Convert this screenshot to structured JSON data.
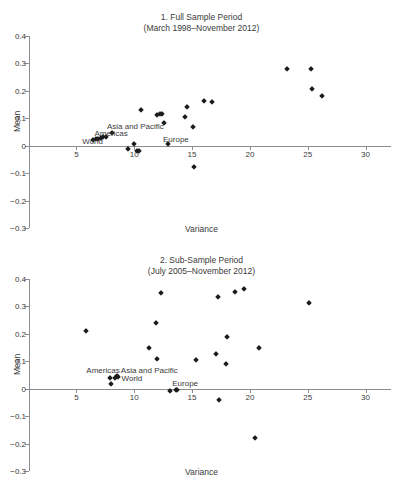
{
  "figure": {
    "axis_color": "#8d8d8d",
    "marker_color": "#1c1c1c",
    "text_color": "#3a3a3a",
    "xlabel": "Variance",
    "ylabel": "Mean",
    "y_ticks": [
      "0.4",
      "0.3",
      "0.2",
      "0.1",
      "0",
      "-0.1",
      "-0.2",
      "-0.3"
    ],
    "x_ticks": [
      "5",
      "10",
      "15",
      "20",
      "25",
      "30"
    ]
  },
  "chart_data": [
    {
      "type": "scatter",
      "title": "1. Full Sample Period",
      "subtitle": "(March 1998–November 2012)",
      "xlabel": "Variance",
      "ylabel": "Mean",
      "xlim": [
        0,
        30
      ],
      "ylim": [
        -0.3,
        0.4
      ],
      "grid": false,
      "legend": "none",
      "x_ticks": [
        5,
        10,
        15,
        20,
        25,
        30
      ],
      "y_ticks": [
        -0.3,
        -0.2,
        -0.1,
        0,
        0.1,
        0.2,
        0.3,
        0.4
      ],
      "points": [
        {
          "x": 6.4,
          "y": 0.022
        },
        {
          "x": 6.7,
          "y": 0.024
        },
        {
          "x": 6.9,
          "y": 0.026
        },
        {
          "x": 7.1,
          "y": 0.028
        },
        {
          "x": 7.3,
          "y": 0.03
        },
        {
          "x": 7.6,
          "y": 0.033
        },
        {
          "x": 8.1,
          "y": 0.046
        },
        {
          "x": 9.5,
          "y": -0.012
        },
        {
          "x": 10.0,
          "y": 0.005
        },
        {
          "x": 10.2,
          "y": -0.018
        },
        {
          "x": 10.4,
          "y": -0.02
        },
        {
          "x": 10.6,
          "y": 0.129
        },
        {
          "x": 12.0,
          "y": 0.113
        },
        {
          "x": 12.2,
          "y": 0.116
        },
        {
          "x": 12.4,
          "y": 0.114
        },
        {
          "x": 12.6,
          "y": 0.081
        },
        {
          "x": 12.9,
          "y": 0.008
        },
        {
          "x": 14.4,
          "y": 0.106
        },
        {
          "x": 14.6,
          "y": 0.14
        },
        {
          "x": 15.1,
          "y": 0.069
        },
        {
          "x": 15.2,
          "y": -0.077
        },
        {
          "x": 16.0,
          "y": 0.163
        },
        {
          "x": 16.7,
          "y": 0.16
        },
        {
          "x": 23.2,
          "y": 0.278
        },
        {
          "x": 25.3,
          "y": 0.28
        },
        {
          "x": 25.4,
          "y": 0.208
        },
        {
          "x": 26.2,
          "y": 0.182
        }
      ],
      "annotations": [
        {
          "text": "Asia and Pacific",
          "x": 10.1,
          "y": 0.072
        },
        {
          "text": "Americas",
          "x": 8.0,
          "y": 0.046
        },
        {
          "text": "World",
          "x": 6.4,
          "y": 0.018
        },
        {
          "text": "Europe",
          "x": 13.6,
          "y": 0.024
        }
      ]
    },
    {
      "type": "scatter",
      "title": "2. Sub-Sample Period",
      "subtitle": "(July 2005–November 2012)",
      "xlabel": "Variance",
      "ylabel": "Mean",
      "xlim": [
        0,
        30
      ],
      "ylim": [
        -0.3,
        0.4
      ],
      "grid": false,
      "legend": "none",
      "x_ticks": [
        5,
        10,
        15,
        20,
        25,
        30
      ],
      "y_ticks": [
        -0.3,
        -0.2,
        -0.1,
        0,
        0.1,
        0.2,
        0.3,
        0.4
      ],
      "points": [
        {
          "x": 5.8,
          "y": 0.212
        },
        {
          "x": 7.9,
          "y": 0.038
        },
        {
          "x": 8.0,
          "y": 0.016
        },
        {
          "x": 8.3,
          "y": 0.04
        },
        {
          "x": 8.5,
          "y": 0.048
        },
        {
          "x": 8.6,
          "y": 0.044
        },
        {
          "x": 11.3,
          "y": 0.148
        },
        {
          "x": 11.9,
          "y": 0.24
        },
        {
          "x": 12.0,
          "y": 0.109
        },
        {
          "x": 12.3,
          "y": 0.348
        },
        {
          "x": 13.1,
          "y": -0.007
        },
        {
          "x": 13.6,
          "y": -0.004
        },
        {
          "x": 13.7,
          "y": -0.005
        },
        {
          "x": 15.3,
          "y": 0.105
        },
        {
          "x": 17.1,
          "y": 0.128
        },
        {
          "x": 17.2,
          "y": 0.334
        },
        {
          "x": 17.3,
          "y": -0.042
        },
        {
          "x": 17.9,
          "y": 0.09
        },
        {
          "x": 18.0,
          "y": 0.19
        },
        {
          "x": 18.7,
          "y": 0.354
        },
        {
          "x": 19.5,
          "y": 0.364
        },
        {
          "x": 20.4,
          "y": -0.181
        },
        {
          "x": 20.8,
          "y": 0.148
        },
        {
          "x": 25.1,
          "y": 0.314
        }
      ],
      "annotations": [
        {
          "text": "Americas",
          "x": 7.3,
          "y": 0.07
        },
        {
          "text": "Asia and Pacific",
          "x": 11.3,
          "y": 0.07
        },
        {
          "text": "World",
          "x": 9.8,
          "y": 0.04
        },
        {
          "text": "Europe",
          "x": 14.4,
          "y": 0.022
        }
      ]
    }
  ]
}
